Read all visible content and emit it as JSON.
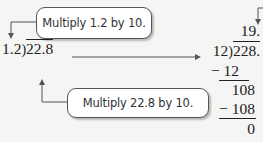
{
  "callouts": {
    "top": "Multiply 1.2 by 10.",
    "bottom": "Multiply 22.8 by 10."
  },
  "original_problem": {
    "divisor": "1.2",
    "dividend": "22.8"
  },
  "long_division": {
    "quotient": "19.",
    "divisor": "12",
    "dividend": "228.",
    "steps": [
      {
        "subtract": "− 12",
        "remainder": "108"
      },
      {
        "subtract": "− 108",
        "remainder": "0"
      }
    ]
  },
  "colors": {
    "background": "#f5f5f3",
    "text": "#222222",
    "arrow": "#555555"
  }
}
